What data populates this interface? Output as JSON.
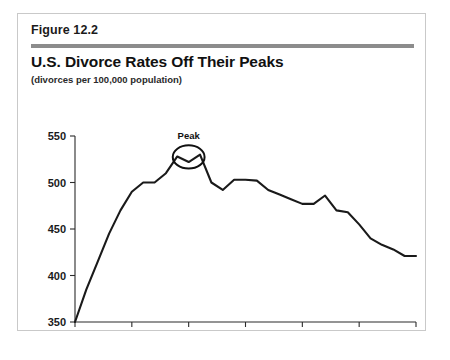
{
  "figure": {
    "label": "Figure 12.2",
    "title": "U.S. Divorce Rates Off Their Peaks",
    "subtitle": "(divorces per 100,000 population)",
    "rule_color": "#8c8c8c",
    "border_color": "#c9c9c9"
  },
  "chart_data": {
    "type": "line",
    "title": "U.S. Divorce Rates Off Their Peaks",
    "subtitle": "(divorces per 100,000 population)",
    "xlabel": "",
    "ylabel": "",
    "xlim": [
      1970,
      2000
    ],
    "ylim": [
      350,
      550
    ],
    "xticks": [
      1970,
      1975,
      1980,
      1985,
      1990,
      1995,
      2000
    ],
    "xticklabels": [
      "1970",
      "1975",
      "1980",
      "1985",
      "1990",
      "1995",
      "2000"
    ],
    "yticks": [
      350,
      400,
      450,
      500,
      550
    ],
    "yticklabels": [
      "350",
      "400",
      "450",
      "500",
      "550"
    ],
    "grid": false,
    "legend": false,
    "line_color": "#1a1a1a",
    "x": [
      1970,
      1971,
      1972,
      1973,
      1974,
      1975,
      1976,
      1977,
      1978,
      1979,
      1980,
      1981,
      1982,
      1983,
      1984,
      1985,
      1986,
      1987,
      1988,
      1989,
      1990,
      1991,
      1992,
      1993,
      1994,
      1995,
      1996,
      1997,
      1998,
      1999,
      2000
    ],
    "values": [
      350,
      385,
      415,
      445,
      470,
      490,
      500,
      500,
      510,
      528,
      522,
      530,
      500,
      492,
      503,
      503,
      502,
      492,
      487,
      482,
      477,
      477,
      486,
      470,
      468,
      455,
      440,
      433,
      428,
      421,
      421
    ],
    "annotations": [
      {
        "text": "Peak",
        "type": "ellipse-callout",
        "x_range": [
          1978.6,
          1981.4
        ],
        "y_range": [
          515,
          540
        ],
        "label_x": 1980,
        "label_y": 547
      }
    ]
  }
}
